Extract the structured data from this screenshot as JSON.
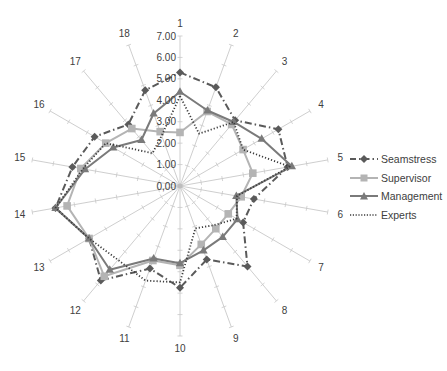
{
  "chart_data": {
    "type": "radar",
    "title": "",
    "categories": [
      "1",
      "2",
      "3",
      "4",
      "5",
      "6",
      "7",
      "8",
      "9",
      "10",
      "11",
      "12",
      "13",
      "14",
      "15",
      "16",
      "17",
      "18"
    ],
    "radial_axis": {
      "min": 0,
      "max": 7,
      "step": 1,
      "tick_labels": [
        "0,00",
        "1.00",
        "2.00",
        "3.00",
        "4.00",
        "5.00",
        "6.00",
        "7.00"
      ]
    },
    "series": [
      {
        "name": "Seamstress",
        "color": "#5a5a5a",
        "line": "dash-dot",
        "marker": "diamond",
        "values": [
          5.3,
          4.9,
          4.0,
          5.3,
          5.1,
          3.5,
          3.4,
          4.9,
          3.65,
          4.75,
          4.1,
          5.75,
          4.9,
          5.9,
          5.1,
          4.6,
          3.75,
          4.75
        ]
      },
      {
        "name": "Supervisor",
        "color": "#b4b4b4",
        "line": "solid",
        "marker": "square",
        "values": [
          2.5,
          3.7,
          3.75,
          3.4,
          3.45,
          2.9,
          2.6,
          2.6,
          2.9,
          3.7,
          3.7,
          5.5,
          4.9,
          5.35,
          4.7,
          4.0,
          3.5,
          2.7
        ]
      },
      {
        "name": "Management",
        "color": "#7a7a7a",
        "line": "solid",
        "marker": "triangle",
        "values": [
          4.4,
          3.75,
          3.9,
          4.4,
          5.3,
          2.67,
          3.1,
          3.1,
          3.2,
          3.6,
          3.6,
          5.1,
          4.9,
          5.9,
          4.5,
          3.6,
          2.8,
          3.6
        ]
      },
      {
        "name": "Experts",
        "color": "#3c3c3c",
        "line": "dotted",
        "marker": "none",
        "values": [
          4.2,
          2.6,
          3.9,
          3.4,
          5.2,
          2.7,
          3.05,
          2.4,
          2.1,
          4.5,
          4.7,
          4.5,
          4.9,
          5.9,
          4.6,
          4.0,
          2.0,
          2.5
        ]
      }
    ],
    "grid": true,
    "legend_position": "right"
  },
  "legend": {
    "items": [
      {
        "label": "Seamstress"
      },
      {
        "label": "Supervisor"
      },
      {
        "label": "Management"
      },
      {
        "label": "Experts"
      }
    ]
  }
}
